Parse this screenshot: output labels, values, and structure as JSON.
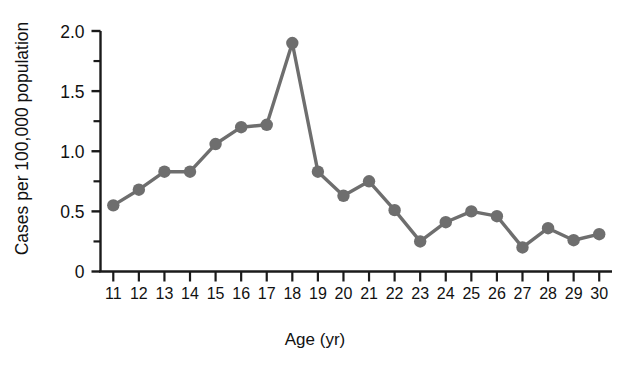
{
  "chart_data": {
    "type": "line",
    "title": "",
    "xlabel": "Age (yr)",
    "ylabel": "Cases per 100,000 population",
    "x": [
      11,
      12,
      13,
      14,
      15,
      16,
      17,
      18,
      19,
      20,
      21,
      22,
      23,
      24,
      25,
      26,
      27,
      28,
      29,
      30
    ],
    "values": [
      0.55,
      0.68,
      0.83,
      0.83,
      1.06,
      1.2,
      1.22,
      1.9,
      0.83,
      0.63,
      0.75,
      0.51,
      0.25,
      0.41,
      0.5,
      0.46,
      0.2,
      0.36,
      0.26,
      0.31
    ],
    "series": [
      {
        "name": "Cases per 100,000 population",
        "values": [
          0.55,
          0.68,
          0.83,
          0.83,
          1.06,
          1.2,
          1.22,
          1.9,
          0.83,
          0.63,
          0.75,
          0.51,
          0.25,
          0.41,
          0.5,
          0.46,
          0.2,
          0.36,
          0.26,
          0.31
        ]
      }
    ],
    "xlim": [
      10.5,
      30.5
    ],
    "ylim": [
      0,
      2.0
    ],
    "ytick_labels": [
      "2.0",
      "1.5",
      "1.0",
      "0.5",
      "0"
    ],
    "ytick_values": [
      2.0,
      1.5,
      1.0,
      0.5,
      0
    ],
    "yminor_tick_values": [
      1.75,
      1.25,
      0.75,
      0.25
    ],
    "xtick_labels": [
      "11",
      "12",
      "13",
      "14",
      "15",
      "16",
      "17",
      "18",
      "19",
      "20",
      "21",
      "22",
      "23",
      "24",
      "25",
      "26",
      "27",
      "28",
      "29",
      "30"
    ],
    "grid": false,
    "legend": null,
    "legend_position": "none",
    "marker": "circle",
    "colors": {
      "line": "#6e6e6e",
      "marker": "#6e6e6e",
      "axis": "#1a1a1a",
      "text": "#111111",
      "background": "#ffffff"
    }
  }
}
